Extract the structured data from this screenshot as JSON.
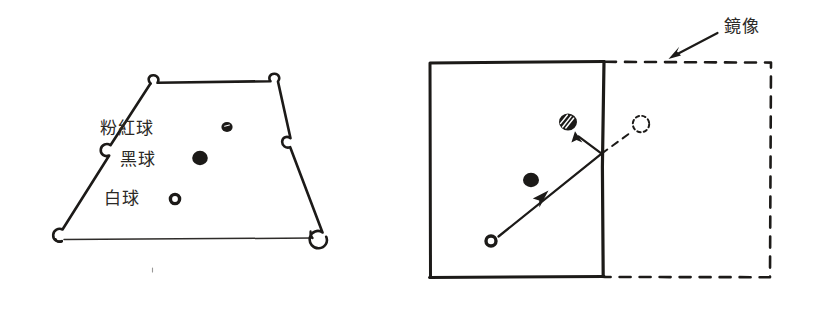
{
  "figure": {
    "background_color": "#ffffff",
    "ink_color": "#1c1a18",
    "text_color": "#2b2926",
    "width": 818,
    "height": 310
  },
  "left_figure": {
    "name": "snooker-table-trapezoid",
    "description": "Hand drawn trapezoid billiard table in perspective with six pocket notches",
    "labels": [
      {
        "id": "pink",
        "text": "粉紅球",
        "x": 100,
        "y": 129,
        "ball_cx": 227,
        "ball_cy": 127,
        "ball_r": 5.2,
        "ball_style": "solid"
      },
      {
        "id": "black",
        "text": "黑球",
        "x": 120,
        "y": 160,
        "ball_cx": 200,
        "ball_cy": 158,
        "ball_r": 7.4,
        "ball_style": "solid"
      },
      {
        "id": "white",
        "text": "白球",
        "x": 104,
        "y": 199,
        "ball_cx": 175,
        "ball_cy": 199,
        "ball_r": 5.6,
        "ball_style": "hollow"
      }
    ]
  },
  "right_figure": {
    "name": "mirror-reflection-diagram",
    "mirror_label": {
      "text": "鏡像",
      "x": 742,
      "y": 27
    },
    "solid_table": {
      "x": 430,
      "y": 62,
      "width": 173,
      "height": 215,
      "style": "solid"
    },
    "mirror_table": {
      "x": 603,
      "y": 62,
      "width": 168,
      "height": 215,
      "style": "dashed"
    },
    "balls": [
      {
        "id": "cue-ball",
        "cx": 491,
        "cy": 241,
        "r": 6.2,
        "style": "hollow"
      },
      {
        "id": "black-ball",
        "cx": 531,
        "cy": 180,
        "r": 7.6,
        "style": "solid"
      },
      {
        "id": "pink-ball",
        "cx": 568,
        "cy": 122,
        "r": 9.0,
        "style": "hatched"
      },
      {
        "id": "mirrored-pink-ball",
        "cx": 641,
        "cy": 124,
        "r": 8.4,
        "style": "dashed"
      }
    ],
    "paths": [
      {
        "id": "cue-to-cushion",
        "style": "solid-arrow",
        "from_x": 499,
        "from_y": 236,
        "to_x": 602,
        "to_y": 153
      },
      {
        "id": "cushion-to-pink",
        "style": "solid-arrow",
        "from_x": 602,
        "from_y": 153,
        "to_x": 576,
        "to_y": 133
      },
      {
        "id": "cushion-to-mirror-image",
        "style": "dashed-sight-line",
        "from_x": 602,
        "from_y": 153,
        "to_x": 634,
        "to_y": 130
      }
    ],
    "pointer_arrow": {
      "id": "mirror-label-pointer",
      "from_x": 718,
      "from_y": 32,
      "to_x": 671,
      "to_y": 57
    }
  }
}
